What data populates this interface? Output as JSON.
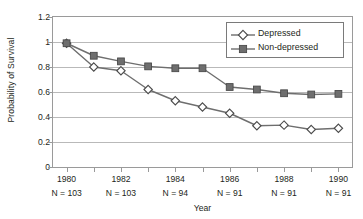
{
  "chart_data": {
    "type": "line",
    "title": "",
    "xlabel": "Year",
    "ylabel": "Probability of Survival",
    "xlim": [
      1979.5,
      1990.5
    ],
    "ylim": [
      0,
      1.2
    ],
    "grid": true,
    "grid_axis": "y",
    "legend_position": "top-right",
    "x": [
      1980,
      1981,
      1982,
      1983,
      1984,
      1985,
      1986,
      1987,
      1988,
      1989,
      1990
    ],
    "series": [
      {
        "name": "Depressed",
        "marker": "open-diamond",
        "color": "#6e6e6e",
        "values": [
          0.99,
          0.8,
          0.77,
          0.62,
          0.53,
          0.48,
          0.43,
          0.33,
          0.335,
          0.3,
          0.31
        ]
      },
      {
        "name": "Non-depressed",
        "marker": "filled-square",
        "color": "#6e6e6e",
        "values": [
          0.99,
          0.89,
          0.845,
          0.805,
          0.79,
          0.79,
          0.64,
          0.62,
          0.59,
          0.58,
          0.585
        ]
      }
    ],
    "ytick_labels": [
      "0",
      "0.2",
      "0.4",
      "0.6",
      "0.8",
      "1",
      "1.2"
    ],
    "ytick_values": [
      0,
      0.2,
      0.4,
      0.6,
      0.8,
      1,
      1.2
    ],
    "xtick_values": [
      1980,
      1981,
      1982,
      1983,
      1984,
      1985,
      1986,
      1987,
      1988,
      1989,
      1990
    ],
    "xtick_labels": [
      {
        "year": 1980,
        "label": "1980",
        "n_label": "N = 103"
      },
      {
        "year": 1982,
        "label": "1982",
        "n_label": "N = 103"
      },
      {
        "year": 1984,
        "label": "1984",
        "n_label": "N = 94"
      },
      {
        "year": 1986,
        "label": "1986",
        "n_label": "N = 91"
      },
      {
        "year": 1988,
        "label": "1988",
        "n_label": "N = 91"
      },
      {
        "year": 1990,
        "label": "1990",
        "n_label": "N = 91"
      }
    ]
  },
  "legend": {
    "entries": [
      {
        "label": "Depressed"
      },
      {
        "label": "Non-depressed"
      }
    ]
  },
  "colors": {
    "line": "#6e6e6e",
    "marker_fill": "#6e6e6e",
    "marker_edge": "#4a4a4a",
    "grid": "#b9b9b9",
    "axis": "#9a9a9a",
    "text": "#231f20",
    "background": "#ffffff"
  }
}
